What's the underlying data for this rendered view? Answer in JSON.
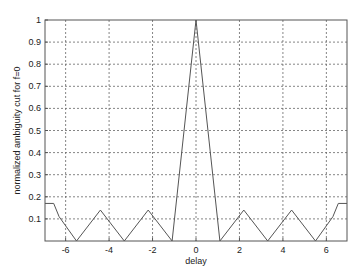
{
  "chart_data": {
    "type": "line",
    "title": "",
    "xlabel": "delay",
    "ylabel": "normalized ambiguity cut for f=0",
    "xlim": [
      -6.95,
      6.95
    ],
    "ylim": [
      0,
      1
    ],
    "grid": true,
    "legend": null,
    "x_ticks": [
      -6,
      -4,
      -2,
      0,
      2,
      4,
      6
    ],
    "x_tick_labels": [
      "-6",
      "-4",
      "-2",
      "0",
      "2",
      "4",
      "6"
    ],
    "y_ticks": [
      0.1,
      0.2,
      0.3,
      0.4,
      0.5,
      0.6,
      0.7,
      0.8,
      0.9,
      1
    ],
    "y_tick_labels": [
      "0.1",
      "0.2",
      "0.3",
      "0.4",
      "0.5",
      "0.6",
      "0.7",
      "0.8",
      "0.9",
      "1"
    ],
    "series": [
      {
        "name": "ambiguity cut",
        "color": "#555555",
        "x": [
          -6.95,
          -6.55,
          -6.3,
          -5.5,
          -4.4,
          -3.3,
          -2.2,
          -1.1,
          0,
          1.1,
          2.2,
          3.3,
          4.4,
          5.5,
          6.3,
          6.55,
          6.95
        ],
        "y": [
          0.17,
          0.17,
          0.11,
          0,
          0.14,
          0,
          0.14,
          0,
          1,
          0,
          0.14,
          0,
          0.14,
          0,
          0.11,
          0.17,
          0.17
        ]
      }
    ]
  },
  "axes_box": {
    "left": 45,
    "top": 20,
    "right": 347,
    "bottom": 241
  }
}
